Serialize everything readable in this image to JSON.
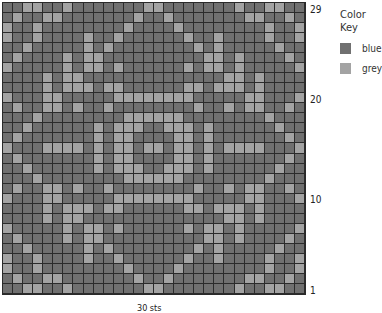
{
  "legend": {
    "title": "Color Key",
    "items": [
      {
        "label": "blue",
        "color": "#707070",
        "code": "B"
      },
      {
        "label": "grey",
        "color": "#a3a3a3",
        "code": "G"
      }
    ]
  },
  "row_labels": [
    {
      "label": "29",
      "row": 29
    },
    {
      "label": "20",
      "row": 20
    },
    {
      "label": "10",
      "row": 10
    },
    {
      "label": "1",
      "row": 1
    }
  ],
  "footer": "30 sts",
  "grid": {
    "columns": 30,
    "rows": 29,
    "cells": [
      "BBGGBBGBBBBBBBGGBBBBBBBGBBGGBB",
      "BGBBGGBBBBBBBGBBGBBBBBBBGGBBGB",
      "GBBGBBBBBBBBGBBBBGBBBBBBBBGBBG",
      "GBBGBBBBGBBGBBBBBBGBBGBBBBGBBG",
      "BBGBBBBBGBGBBBBBBBBGBGBBBBBGBB",
      "BGBBBBGBGGBBBBBBBBBBGGBGBBBBGB",
      "GBBBBBGBGGBGBBBBBBGBGGBGBBBBBG",
      "BBBBGBGGBBBBBBBBBBBBBBGGBGBBBB",
      "BBBBGBGGGBGGBBBBBBGGBGGGBGBBBB",
      "GBBBGGBBBBBGGGGGGGGBBBBBGGBBBG",
      "BGBBGGBGBBGBBBBBBBBGBBGBGGBBGB",
      "BBBGBBBBBBBBGGGGGGBBBBBBBBGBBB",
      "BBGBBBBBBGBGGGBBGGGBGBBBBBBGBB",
      "BGBBBBBBBGBGGBBBBGGBGBBBBBBBGB",
      "GBBBGGGGBGBGGBGGBGGBGBGGGGBBBG",
      "BGBBBBBBBGBGGBBBBGGBGBBBBBBBGB",
      "BBGBBBBBBGBGGGBBGGGBGBBBBBBGBB",
      "BBBGBBBBBBBBGGGGGGBBBBBBBBGBBB",
      "BGBBGGBGBBGBBBBBBBBGBBGBGGBBGB",
      "GBBBGGBBBBBGGGGGGGGBBBBBGGBBBG",
      "BBBBGBGGGBGGBBBBBBGGBGGGBGBBBB",
      "BBBBGBGGBBBBBBBBBBBBBBGGBGBBBB",
      "GBBBBBGBGGBGBBBBBBGBGGBGBBBBBG",
      "BGBBBBGBGGBBBBBBBBBBGGBGBBBBGB",
      "BBGBBBBBGBGBBBBBBBBGBGBBBBBGBB",
      "GBBGBBBBGBBGBBBBBBGBBGBBBBGBBG",
      "GBBGBBBBBBBBGBBBBGBBBBBBBBGBBG",
      "BGBBGGBBBBBBBGBBGBBBBBBBGGBBGB",
      "BBGGBBGBBBBBBBGGBBBBBBBGBBGGBB"
    ]
  }
}
